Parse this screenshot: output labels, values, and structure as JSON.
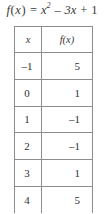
{
  "title": {
    "full_text": "f(x) = x^2 - 3x + 1",
    "function_name": "f",
    "argument": "x",
    "equals": "=",
    "term_variable": "x",
    "exponent": "2",
    "minus": "–",
    "linear_term": "3x",
    "plus": "+",
    "constant": "1"
  },
  "table": {
    "headers": {
      "x": "x",
      "fx": "f(x)"
    },
    "rows": [
      {
        "x": "–1",
        "fx": "5"
      },
      {
        "x": "0",
        "fx": "1"
      },
      {
        "x": "1",
        "fx": "–1"
      },
      {
        "x": "2",
        "fx": "–1"
      },
      {
        "x": "3",
        "fx": "1"
      },
      {
        "x": "4",
        "fx": "5"
      }
    ]
  },
  "chart_data": {
    "type": "table",
    "columns": [
      "x",
      "f(x)"
    ],
    "x": [
      -1,
      0,
      1,
      2,
      3,
      4
    ],
    "values": [
      5,
      1,
      -1,
      -1,
      1,
      5
    ],
    "rows": [
      [
        -1,
        5
      ],
      [
        0,
        1
      ],
      [
        1,
        -1
      ],
      [
        2,
        -1
      ],
      [
        3,
        1
      ],
      [
        4,
        5
      ]
    ],
    "xlabel": "x",
    "ylabel": "f(x)"
  },
  "colors": {
    "background": "#ffffff",
    "border": "#8d8d8d",
    "text": "#2e2e2e",
    "title_text": "#3a3a3a"
  }
}
